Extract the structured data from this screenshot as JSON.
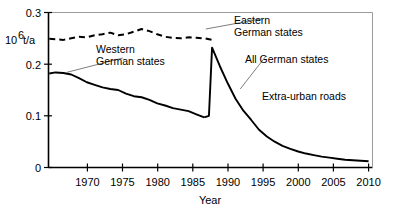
{
  "chart_data": {
    "type": "line",
    "title": "",
    "xlabel": "Year",
    "ylabel": "10^6 t/a",
    "ylabel_base": "10",
    "ylabel_exp": "6",
    "ylabel_unit": " t/a",
    "xlim": [
      1969.1,
      2010.5
    ],
    "ylim": [
      0,
      0.3
    ],
    "xticks": [
      1970,
      1975,
      1980,
      1985,
      1990,
      1995,
      2000,
      2005,
      2010
    ],
    "xtick_labels": [
      "1970",
      "1975",
      "1980",
      "1985",
      "1990",
      "1995",
      "2000",
      "2005",
      "2010"
    ],
    "yticks": [
      0,
      0.1,
      0.2,
      0.3
    ],
    "ytick_labels": [
      "0",
      "0.1",
      "0.2",
      "0.3"
    ],
    "grid": false,
    "legend_position": "inline-annotations",
    "annotations": [
      {
        "name": "extra-urban-roads",
        "text": "Extra-urban roads",
        "x": 1999.5,
        "y": 0.128
      }
    ],
    "series": [
      {
        "name": "Eastern German states",
        "label": "Eastern\nGerman states",
        "label_line1": "Eastern",
        "label_line2": "German states",
        "style": "dashed",
        "color": "#000000",
        "x": [
          1969.2,
          1970,
          1971,
          1972,
          1973,
          1974,
          1975,
          1976,
          1977,
          1978,
          1979,
          1980,
          1981,
          1982,
          1983,
          1984,
          1985,
          1986,
          1987,
          1988,
          1989,
          1990
        ],
        "y": [
          0.249,
          0.248,
          0.247,
          0.25,
          0.253,
          0.252,
          0.256,
          0.258,
          0.261,
          0.256,
          0.258,
          0.263,
          0.268,
          0.264,
          0.258,
          0.253,
          0.251,
          0.25,
          0.252,
          0.251,
          0.25,
          0.247
        ]
      },
      {
        "name": "Western German states",
        "label": "Western\nGerman states",
        "label_line1": "Western",
        "label_line2": "German states",
        "style": "solid",
        "color": "#000000",
        "x": [
          1969.2,
          1970,
          1971,
          1972,
          1973,
          1974,
          1975,
          1976,
          1977,
          1978,
          1979,
          1980,
          1981,
          1982,
          1983,
          1984,
          1985,
          1986,
          1987,
          1988,
          1989
        ],
        "y": [
          0.182,
          0.184,
          0.183,
          0.18,
          0.173,
          0.165,
          0.16,
          0.155,
          0.152,
          0.15,
          0.143,
          0.138,
          0.136,
          0.131,
          0.124,
          0.12,
          0.115,
          0.112,
          0.109,
          0.103,
          0.097
        ]
      },
      {
        "name": "All German states",
        "label": "All German states",
        "style": "solid",
        "color": "#000000",
        "x": [
          1989,
          1989.6,
          1990,
          1991,
          1992,
          1993,
          1994,
          1995,
          1996,
          1997,
          1998,
          1999,
          2000,
          2001,
          2002,
          2003,
          2004,
          2005,
          2006,
          2007,
          2008,
          2009,
          2010
        ],
        "y": [
          0.097,
          0.1,
          0.232,
          0.196,
          0.163,
          0.133,
          0.11,
          0.092,
          0.073,
          0.06,
          0.05,
          0.042,
          0.036,
          0.031,
          0.027,
          0.024,
          0.021,
          0.019,
          0.017,
          0.015,
          0.014,
          0.013,
          0.012
        ]
      }
    ],
    "leader_lines": [
      {
        "name": "leader-western",
        "x1": 1978.6,
        "y1": 0.212,
        "x2": 1971.4,
        "y2": 0.184
      },
      {
        "name": "leader-eastern",
        "x1": 1989.2,
        "y1": 0.268,
        "x2": 1996.4,
        "y2": 0.288
      },
      {
        "name": "leader-all",
        "x1": 1993.6,
        "y1": 0.152,
        "x2": 1996.8,
        "y2": 0.214
      }
    ]
  }
}
